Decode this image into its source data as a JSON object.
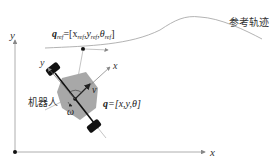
{
  "diagram": {
    "world_axes": {
      "x_label": "x",
      "y_label": "y"
    },
    "reference_trajectory": {
      "label": "参考轨迹",
      "ref_state_label": "q",
      "ref_state_sub": "ref",
      "ref_state_eq": "=[x",
      "ref_x_sub": "ref",
      "ref_y": ",y",
      "ref_y_sub": "ref",
      "ref_theta": ",θ",
      "ref_theta_sub": "ref",
      "ref_close": "]"
    },
    "robot": {
      "label": "机器人",
      "body_x_label": "x",
      "body_y_label": "y",
      "velocity_label": "v",
      "angular_label": "ω",
      "state_label": "q",
      "state_eq": "=[x,y,θ]"
    },
    "colors": {
      "body": "#a8a8a8",
      "wheel": "#111111",
      "line": "#999999",
      "axis": "#777777",
      "text": "#333333"
    }
  }
}
